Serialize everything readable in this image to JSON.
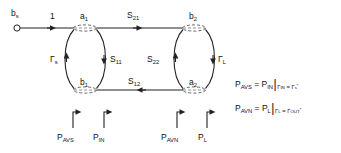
{
  "diagram": {
    "source_terminal": {
      "name": "source-terminal",
      "label_b": "b",
      "label_sub": "s"
    },
    "branch_labels": {
      "unity": "1",
      "s21": "S",
      "s21_sub": "21",
      "s11": "S",
      "s11_sub": "11",
      "s22": "S",
      "s22_sub": "22",
      "s12": "S",
      "s12_sub": "12",
      "gamma_s": "Γ",
      "gamma_s_sub": "s",
      "gamma_l": "Γ",
      "gamma_l_sub": "L"
    },
    "nodes": [
      {
        "id": "a1",
        "base": "a",
        "sub": "1"
      },
      {
        "id": "b2",
        "base": "b",
        "sub": "2"
      },
      {
        "id": "b1",
        "base": "b",
        "sub": "1"
      },
      {
        "id": "a2",
        "base": "a",
        "sub": "2"
      }
    ],
    "power_markers": [
      {
        "id": "p-avs",
        "base": "P",
        "sub": "AVS"
      },
      {
        "id": "p-in",
        "base": "P",
        "sub": "IN"
      },
      {
        "id": "p-avn",
        "base": "P",
        "sub": "AVN"
      },
      {
        "id": "p-l",
        "base": "P",
        "sub": "L"
      }
    ],
    "equations": [
      {
        "id": "eq-pavs",
        "lhs_base": "P",
        "lhs_sub": "AVS",
        "equals": "=",
        "rhs_base": "P",
        "rhs_sub": "IN",
        "bar": "|",
        "cond_left_base": "Γ",
        "cond_left_sub": "IN",
        "cond_equals": "=",
        "cond_right_base": "Γ",
        "cond_right_sub": "s",
        "cond_right_sup": "*"
      },
      {
        "id": "eq-pavn",
        "lhs_base": "P",
        "lhs_sub": "AVN",
        "equals": "=",
        "rhs_base": "P",
        "rhs_sub": "L",
        "bar": "|",
        "cond_left_base": "Γ",
        "cond_left_sub": "L",
        "cond_equals": "=",
        "cond_right_base": "Γ",
        "cond_right_sub": "OUT",
        "cond_right_sup": "*"
      }
    ],
    "colors": {
      "line": "#222222",
      "text": "#111111",
      "background": "#ffffff",
      "node_fill": "#ffffff"
    }
  }
}
